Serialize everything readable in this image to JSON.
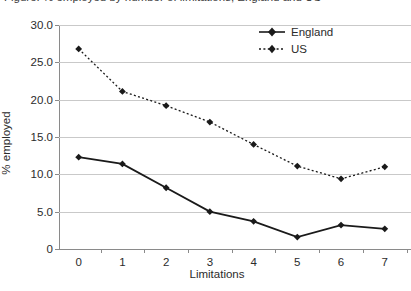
{
  "caption_sliver": "Figure: % employed by number of limitations, England and US",
  "axes": {
    "ylabel": "% employed",
    "xlabel": "Limitations",
    "yticks": [
      "30.0",
      "25.0",
      "20.0",
      "15.0",
      "10.0",
      "5.0",
      "0"
    ],
    "xticks": [
      "0",
      "1",
      "2",
      "3",
      "4",
      "5",
      "6",
      "7"
    ]
  },
  "legend": {
    "position": "top-right",
    "entries": [
      {
        "label": "England",
        "style": "solid",
        "marker": "diamond",
        "color": "#1a1a1a"
      },
      {
        "label": "US",
        "style": "dotted",
        "marker": "diamond",
        "color": "#1a1a1a"
      }
    ]
  },
  "chart_data": {
    "type": "line",
    "title": "",
    "subtitle": "",
    "xlabel": "Limitations",
    "ylabel": "% employed",
    "x": [
      0,
      1,
      2,
      3,
      4,
      5,
      6,
      7
    ],
    "xlim": [
      -0.45,
      7.6
    ],
    "ylim": [
      0,
      30
    ],
    "ytick_values": [
      30.0,
      25.0,
      20.0,
      15.0,
      10.0,
      5.0,
      0
    ],
    "grid": "horizontal",
    "legend_position": "top-right",
    "series": [
      {
        "name": "England",
        "style": "solid",
        "marker": "diamond",
        "color": "#1a1a1a",
        "values": [
          12.3,
          11.4,
          8.2,
          5.0,
          3.7,
          1.6,
          3.2,
          2.7
        ]
      },
      {
        "name": "US",
        "style": "dotted",
        "marker": "diamond",
        "color": "#1a1a1a",
        "values": [
          26.8,
          21.1,
          19.2,
          17.0,
          14.0,
          11.1,
          9.4,
          11.0
        ]
      }
    ],
    "annotations": []
  }
}
